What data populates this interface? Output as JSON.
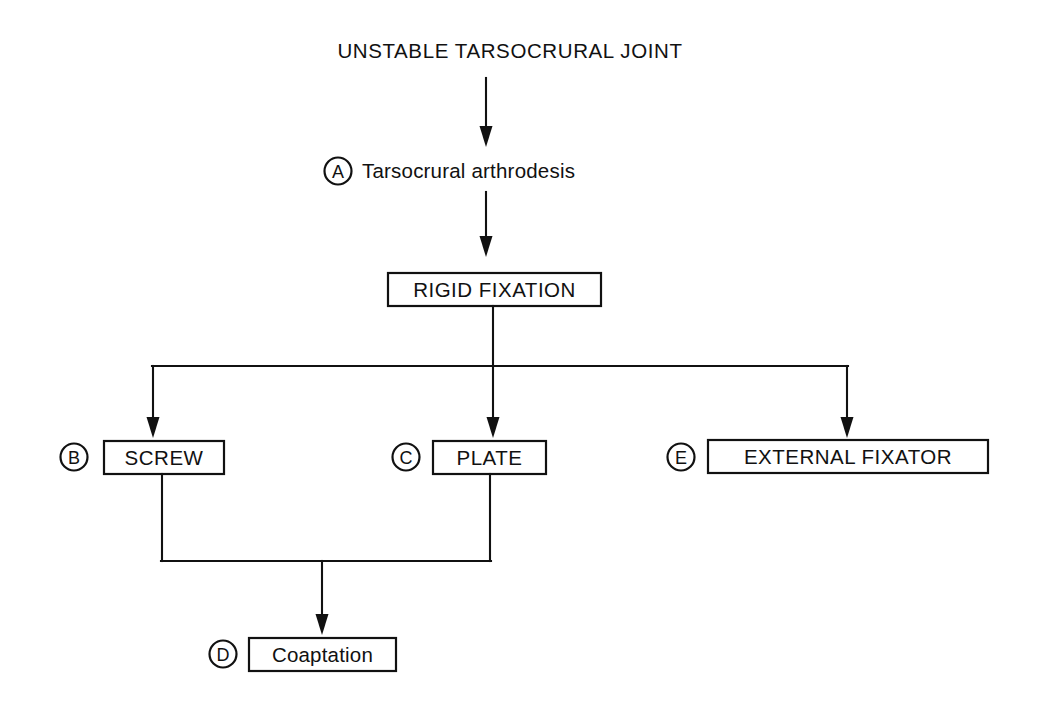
{
  "diagram": {
    "title": "UNSTABLE TARSOCRURAL JOINT",
    "background_color": "#ffffff",
    "line_color": "#111111",
    "nodes": [
      {
        "id": "root",
        "label": "UNSTABLE TARSOCRURAL JOINT",
        "marker": "",
        "boxed": false,
        "case": "upper"
      },
      {
        "id": "arthrodesis",
        "label": "Tarsocrural arthrodesis",
        "marker": "A",
        "boxed": false,
        "case": "mixed"
      },
      {
        "id": "rigid-fixation",
        "label": "RIGID FIXATION",
        "marker": "",
        "boxed": true,
        "case": "upper"
      },
      {
        "id": "screw",
        "label": "SCREW",
        "marker": "B",
        "boxed": true,
        "case": "upper"
      },
      {
        "id": "plate",
        "label": "PLATE",
        "marker": "C",
        "boxed": true,
        "case": "upper"
      },
      {
        "id": "external-fixator",
        "label": "EXTERNAL FIXATOR",
        "marker": "E",
        "boxed": true,
        "case": "upper"
      },
      {
        "id": "coaptation",
        "label": "Coaptation",
        "marker": "D",
        "boxed": true,
        "case": "mixed"
      }
    ],
    "edges": [
      {
        "from": "root",
        "to": "arthrodesis"
      },
      {
        "from": "arthrodesis",
        "to": "rigid-fixation"
      },
      {
        "from": "rigid-fixation",
        "to": "screw"
      },
      {
        "from": "rigid-fixation",
        "to": "plate"
      },
      {
        "from": "rigid-fixation",
        "to": "external-fixator"
      },
      {
        "from": "screw",
        "to": "coaptation"
      },
      {
        "from": "plate",
        "to": "coaptation"
      }
    ]
  }
}
